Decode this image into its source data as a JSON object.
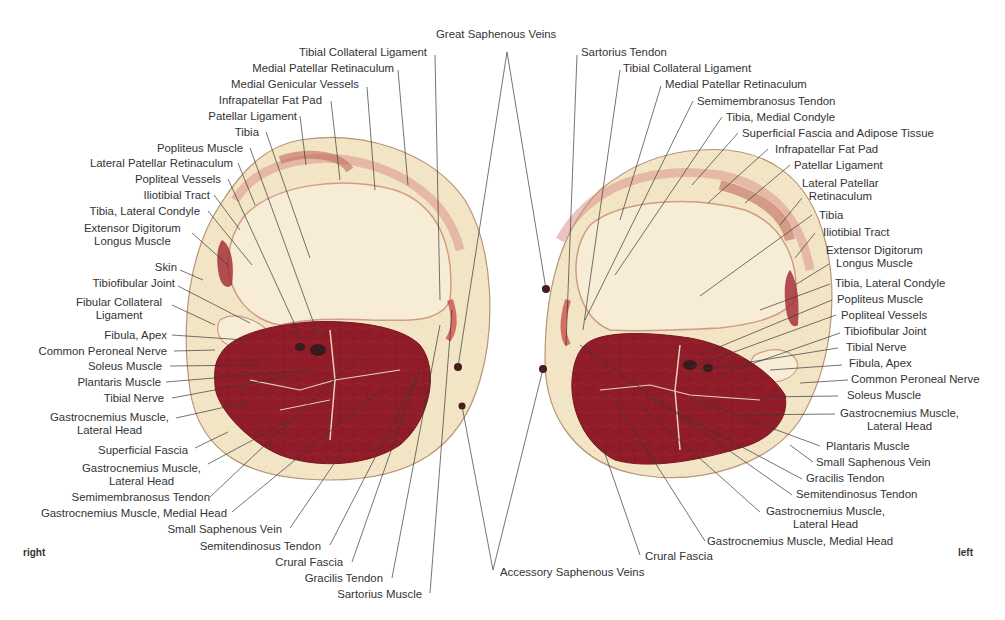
{
  "figure": {
    "top_label": "Great Saphenous Veins",
    "bottom_label": "Accessory Saphenous Veins",
    "side_right": "right",
    "side_left": "left"
  },
  "right_knee": {
    "labels": [
      "Tibial Collateral Ligament",
      "Medial Patellar Retinaculum",
      "Medial Genicular Vessels",
      "Infrapatellar Fat Pad",
      "Patellar Ligament",
      "Tibia",
      "Popliteus Muscle",
      "Lateral Patellar Retinaculum",
      "Popliteal Vessels",
      "Iliotibial Tract",
      "Tibia, Lateral Condyle",
      "Extensor Digitorum\nLongus Muscle",
      "Skin",
      "Tibiofibular Joint",
      "Fibular Collateral\nLigament",
      "Fibula, Apex",
      "Common Peroneal Nerve",
      "Soleus Muscle",
      "Plantaris Muscle",
      "Tibial Nerve",
      "Gastrocnemius Muscle,\nLateral Head",
      "Superficial Fascia",
      "Gastrocnemius Muscle,\nLateral Head",
      "Semimembranosus Tendon",
      "Gastrocnemius Muscle, Medial Head",
      "Small Saphenous Vein",
      "Semitendinosus Tendon",
      "Crural Fascia",
      "Gracilis Tendon",
      "Sartorius Muscle"
    ]
  },
  "left_knee": {
    "labels": [
      "Sartorius Tendon",
      "Tibial Collateral Ligament",
      "Medial Patellar Retinaculum",
      "Semimembranosus Tendon",
      "Tibia, Medial Condyle",
      "Superficial Fascia and Adipose Tissue",
      "Infrapatellar Fat Pad",
      "Patellar Ligament",
      "Lateral Patellar\nRetinaculum",
      "Tibia",
      "Iliotibial Tract",
      "Extensor Digitorum\nLongus Muscle",
      "Tibia, Lateral Condyle",
      "Popliteus Muscle",
      "Popliteal Vessels",
      "Tibiofibular Joint",
      "Tibial Nerve",
      "Fibula, Apex",
      "Common Peroneal Nerve",
      "Soleus Muscle",
      "Gastrocnemius Muscle,\nLateral Head",
      "Plantaris Muscle",
      "Small Saphenous Vein",
      "Gracilis Tendon",
      "Semitendinosus Tendon",
      "Gastrocnemius Muscle,\nLateral Head",
      "Gastrocnemius Muscle, Medial Head",
      "Crural Fascia"
    ]
  },
  "colors": {
    "background": "#ffffff",
    "fat": "#f3e6c6",
    "bone": "#f7ecd6",
    "muscle": "#8f1c28",
    "muscle_dark": "#7a1420",
    "connective": "#d9918a",
    "skin_edge": "#b89478",
    "leader_line": "#3a3a3a",
    "text": "#333333"
  }
}
